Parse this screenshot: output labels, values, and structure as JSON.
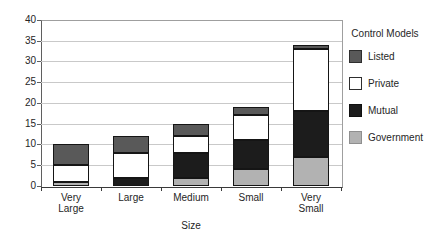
{
  "chart_data": {
    "type": "bar",
    "stacked": true,
    "title": "",
    "xlabel": "Size",
    "ylabel": "",
    "ylim": [
      0,
      40
    ],
    "ytick_step": 5,
    "grid": true,
    "legend_position": "right",
    "legend_title": "Control Models",
    "categories": [
      "Very Large",
      "Large",
      "Medium",
      "Small",
      "Very Small"
    ],
    "category_label_lines": [
      [
        "Very",
        "Large"
      ],
      [
        "Large"
      ],
      [
        "Medium"
      ],
      [
        "Small"
      ],
      [
        "Very",
        "Small"
      ]
    ],
    "series": [
      {
        "name": "Government",
        "color": "#b2b2b2",
        "values": [
          1,
          0,
          2,
          4,
          7
        ]
      },
      {
        "name": "Mutual",
        "color": "#1c1c1c",
        "values": [
          0,
          2,
          6,
          7,
          11
        ]
      },
      {
        "name": "Private",
        "color": "#ffffff",
        "values": [
          4,
          6,
          4,
          6,
          15
        ]
      },
      {
        "name": "Listed",
        "color": "#595959",
        "values": [
          5,
          4,
          3,
          2,
          1
        ]
      }
    ],
    "stack_order_bottom_to_top": [
      "Government",
      "Mutual",
      "Private",
      "Listed"
    ],
    "totals": [
      10,
      12,
      15,
      19,
      34
    ],
    "legend": {
      "title": "Control Models",
      "items": [
        {
          "label": "Listed",
          "color": "#595959",
          "border": "#2e2e2e"
        },
        {
          "label": "Private",
          "color": "#ffffff",
          "border": "#2e2e2e"
        },
        {
          "label": "Mutual",
          "color": "#1c1c1c",
          "border": "#101010"
        },
        {
          "label": "Government",
          "color": "#b2b2b2",
          "border": "#8f8f8f"
        }
      ]
    },
    "colors": {
      "gridline": "#c9c9c9",
      "axis": "#3a3a3a",
      "text": "#262626"
    }
  }
}
